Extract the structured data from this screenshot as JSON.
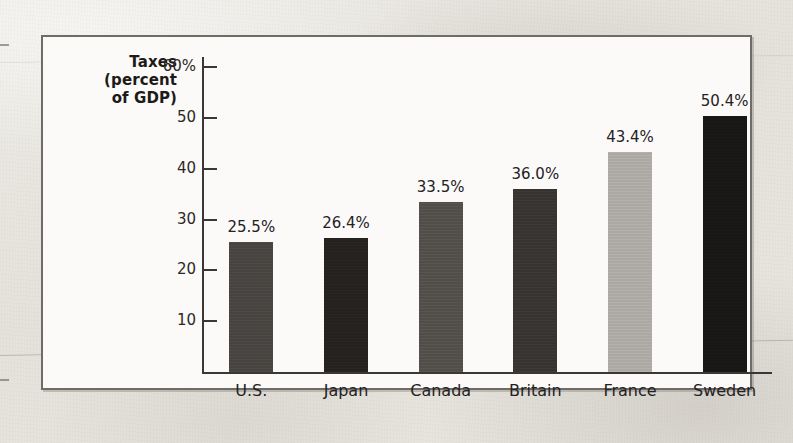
{
  "chart_data": {
    "type": "bar",
    "title": "Taxes (percent of GDP)",
    "title_lines": [
      "Taxes",
      "(percent",
      "of GDP)"
    ],
    "xlabel": "",
    "ylabel": "Taxes (percent of GDP)",
    "categories": [
      "U.S.",
      "Japan",
      "Canada",
      "Britain",
      "France",
      "Sweden"
    ],
    "values": [
      25.5,
      26.4,
      33.5,
      36.0,
      43.4,
      50.4
    ],
    "value_labels": [
      "25.5%",
      "26.4%",
      "33.5%",
      "36.0%",
      "43.4%",
      "50.4%"
    ],
    "bar_colors": [
      "#4a4744",
      "#262321",
      "#55524e",
      "#3a3633",
      "#b0aca7",
      "#1a1816"
    ],
    "ylim": [
      0,
      62
    ],
    "ytick_values": [
      60,
      50,
      40,
      30,
      20,
      10
    ],
    "ytick_labels": [
      "60%",
      "50",
      "40",
      "30",
      "20",
      "10"
    ],
    "grid": false,
    "legend": null
  },
  "figure": {
    "frame_border_color": "#6f6c67",
    "plot_background": "#fbfaf8",
    "page_background": "#e9e7e2",
    "axis_color": "#3a3734"
  }
}
